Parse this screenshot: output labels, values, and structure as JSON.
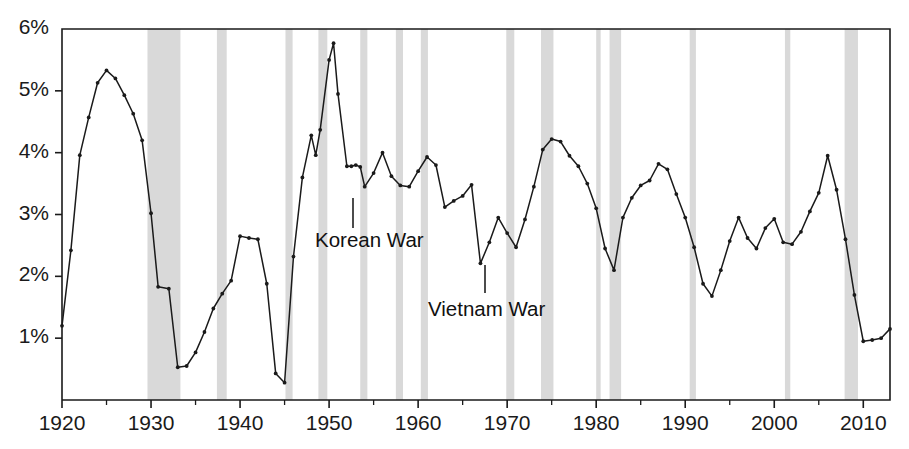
{
  "chart_data": {
    "type": "line",
    "title": "",
    "subtitle": "",
    "xlabel": "",
    "ylabel": "",
    "xlim": [
      1920,
      2013
    ],
    "ylim": [
      0,
      6
    ],
    "yunit": "%",
    "grid": false,
    "legend": "none",
    "ytick_labels": [
      "1%",
      "2%",
      "3%",
      "4%",
      "5%",
      "6%"
    ],
    "ytick_values": [
      1,
      2,
      3,
      4,
      5,
      6
    ],
    "xtick_labels": [
      "1920",
      "1930",
      "1940",
      "1950",
      "1960",
      "1970",
      "1980",
      "1990",
      "2000",
      "2010"
    ],
    "xtick_values": [
      1920,
      1930,
      1940,
      1950,
      1960,
      1970,
      1980,
      1990,
      2000,
      2010
    ],
    "xminor_values": [
      1925,
      1935,
      1945,
      1955,
      1965,
      1975,
      1985,
      1995,
      2005
    ],
    "series": [
      {
        "name": "series-1",
        "marker": "dot",
        "color": "#1a1a1a",
        "x": [
          1920,
          1921,
          1922,
          1923,
          1924,
          1925,
          1926,
          1927,
          1928,
          1929,
          1930,
          1931,
          1932,
          1933,
          1934,
          1935,
          1936,
          1937,
          1938,
          1939,
          1940,
          1941,
          1942,
          1943,
          1944,
          1945,
          1946,
          1947,
          1948,
          1949,
          1950,
          1951,
          1952,
          1953,
          1954,
          1955,
          1956,
          1957,
          1958,
          1959,
          1960,
          1961,
          1962,
          1963,
          1964,
          1965,
          1966,
          1967,
          1968,
          1969,
          1970,
          1971,
          1972,
          1973,
          1974,
          1975,
          1976,
          1977,
          1978,
          1979,
          1980,
          1981,
          1982,
          1983,
          1984,
          1985,
          1986,
          1987,
          1988,
          1989,
          1990,
          1991,
          1992,
          1993,
          1994,
          1995,
          1996,
          1997,
          1998,
          1999,
          2000,
          2001,
          2002,
          2003,
          2004,
          2005,
          2006,
          2007,
          2008,
          2009,
          2010,
          2011,
          2012,
          2013
        ],
        "y": [
          1.2,
          2.42,
          3.96,
          4.57,
          5.13,
          5.33,
          5.2,
          4.93,
          4.63,
          4.2,
          3.02,
          1.83,
          1.8,
          0.53,
          0.55,
          0.77,
          1.1,
          1.48,
          1.72,
          1.93,
          2.65,
          2.62,
          2.6,
          1.88,
          0.43,
          0.28,
          2.32,
          3.6,
          4.28,
          3.96,
          4.37,
          5.5,
          5.77,
          4.95,
          3.78,
          3.78,
          3.8,
          3.77,
          3.45,
          3.67,
          4.0,
          3.62,
          3.47,
          3.45,
          3.7,
          3.93,
          3.8,
          3.12,
          3.22,
          3.3,
          3.48,
          3.46,
          3.42,
          3.35,
          3.12,
          2.8,
          2.21,
          2.55,
          2.95,
          2.7,
          2.47,
          2.92,
          3.45,
          4.05,
          4.22,
          4.18,
          3.95,
          3.78,
          3.5,
          3.1,
          2.45,
          2.1,
          2.95,
          3.27,
          3.47,
          3.55,
          3.82,
          3.73,
          3.33,
          2.95,
          2.47,
          1.88,
          1.68,
          2.1,
          2.57,
          2.95,
          2.62,
          2.45,
          2.78,
          2.93,
          2.55,
          2.52,
          2.72,
          2.63
        ],
        "y_tail": [
          2.63,
          2.7,
          2.77,
          2.82,
          2.95,
          3.05,
          3.0,
          2.92,
          2.93,
          3.12,
          3.07,
          3.2,
          3.35,
          3.52,
          3.57,
          3.7,
          3.95,
          3.4,
          2.6,
          1.7,
          0.95,
          0.92,
          0.97,
          1.0,
          0.93,
          1.05,
          1.15
        ]
      }
    ],
    "series_points": [
      [
        1920,
        1.2
      ],
      [
        1921,
        2.42
      ],
      [
        1922,
        3.96
      ],
      [
        1923,
        4.57
      ],
      [
        1924,
        5.13
      ],
      [
        1925,
        5.33
      ],
      [
        1926,
        5.2
      ],
      [
        1927,
        4.93
      ],
      [
        1928,
        4.63
      ],
      [
        1929,
        4.2
      ],
      [
        1930,
        3.02
      ],
      [
        1930.8,
        1.83
      ],
      [
        1932,
        1.8
      ],
      [
        1933,
        0.53
      ],
      [
        1934,
        0.55
      ],
      [
        1935,
        0.77
      ],
      [
        1936,
        1.1
      ],
      [
        1937,
        1.48
      ],
      [
        1938,
        1.72
      ],
      [
        1939,
        1.93
      ],
      [
        1940,
        2.65
      ],
      [
        1941,
        2.62
      ],
      [
        1942,
        2.6
      ],
      [
        1943,
        1.88
      ],
      [
        1944,
        0.43
      ],
      [
        1945,
        0.28
      ],
      [
        1946,
        2.32
      ],
      [
        1947,
        3.6
      ],
      [
        1948,
        4.28
      ],
      [
        1948.5,
        3.96
      ],
      [
        1949,
        4.37
      ],
      [
        1950,
        5.5
      ],
      [
        1950.5,
        5.77
      ],
      [
        1951,
        4.95
      ],
      [
        1952,
        3.78
      ],
      [
        1952.5,
        3.78
      ],
      [
        1953,
        3.8
      ],
      [
        1953.5,
        3.77
      ],
      [
        1954,
        3.45
      ],
      [
        1955,
        3.67
      ],
      [
        1956,
        4.0
      ],
      [
        1957,
        3.62
      ],
      [
        1958,
        3.47
      ],
      [
        1959,
        3.45
      ],
      [
        1960,
        3.7
      ],
      [
        1961,
        3.93
      ],
      [
        1962,
        3.8
      ],
      [
        1963,
        3.12
      ],
      [
        1964,
        3.22
      ],
      [
        1965,
        3.3
      ],
      [
        1966,
        3.48
      ],
      [
        1967,
        2.21
      ],
      [
        1968,
        2.55
      ],
      [
        1969,
        2.95
      ],
      [
        1970,
        2.7
      ],
      [
        1971,
        2.47
      ],
      [
        1972,
        2.92
      ],
      [
        1973,
        3.45
      ],
      [
        1974,
        4.05
      ],
      [
        1975,
        4.22
      ],
      [
        1976,
        4.18
      ],
      [
        1977,
        3.95
      ],
      [
        1978,
        3.78
      ],
      [
        1979,
        3.5
      ],
      [
        1980,
        3.1
      ],
      [
        1981,
        2.45
      ],
      [
        1982,
        2.1
      ],
      [
        1983,
        2.95
      ],
      [
        1984,
        3.27
      ],
      [
        1985,
        3.47
      ],
      [
        1986,
        3.55
      ],
      [
        1987,
        3.82
      ],
      [
        1988,
        3.73
      ],
      [
        1989,
        3.33
      ],
      [
        1990,
        2.95
      ],
      [
        1991,
        2.47
      ],
      [
        1992,
        1.88
      ],
      [
        1993,
        1.68
      ],
      [
        1994,
        2.1
      ],
      [
        1995,
        2.57
      ],
      [
        1996,
        2.95
      ],
      [
        1997,
        2.62
      ],
      [
        1998,
        2.45
      ],
      [
        1999,
        2.78
      ],
      [
        2000,
        2.93
      ],
      [
        2001,
        2.55
      ],
      [
        2002,
        2.52
      ],
      [
        2003,
        2.72
      ],
      [
        2004,
        3.05
      ],
      [
        2005,
        3.35
      ],
      [
        2006,
        3.95
      ],
      [
        2007,
        3.4
      ],
      [
        2008,
        2.6
      ],
      [
        2009,
        1.7
      ],
      [
        2010,
        0.95
      ],
      [
        2011,
        0.97
      ],
      [
        2012,
        1.0
      ],
      [
        2013,
        1.15
      ]
    ],
    "recession_bands": [
      {
        "start": 1929.6,
        "end": 1933.3
      },
      {
        "start": 1937.4,
        "end": 1938.5
      },
      {
        "start": 1945.1,
        "end": 1945.9
      },
      {
        "start": 1948.8,
        "end": 1949.8
      },
      {
        "start": 1953.5,
        "end": 1954.3
      },
      {
        "start": 1957.5,
        "end": 1958.3
      },
      {
        "start": 1960.3,
        "end": 1961.1
      },
      {
        "start": 1969.9,
        "end": 1970.8
      },
      {
        "start": 1973.8,
        "end": 1975.2
      },
      {
        "start": 1980.0,
        "end": 1980.5
      },
      {
        "start": 1981.5,
        "end": 1982.8
      },
      {
        "start": 1990.5,
        "end": 1991.2
      },
      {
        "start": 2001.2,
        "end": 2001.8
      },
      {
        "start": 2007.9,
        "end": 2009.4
      }
    ],
    "band_color": "#d9d9d9",
    "annotations": [
      {
        "label": "Korean War",
        "x_text": 315,
        "y_text": 228,
        "leader_x": 353,
        "leader_y1": 198,
        "leader_y2": 228
      },
      {
        "label": "Vietnam War",
        "x_text": 428,
        "y_text": 297,
        "leader_x": 485,
        "leader_y1": 265,
        "leader_y2": 293
      }
    ]
  },
  "axes": {
    "plot_left": 62,
    "plot_right": 890,
    "plot_top": 29,
    "plot_bottom": 400,
    "axis_color": "#1a1a1a"
  }
}
